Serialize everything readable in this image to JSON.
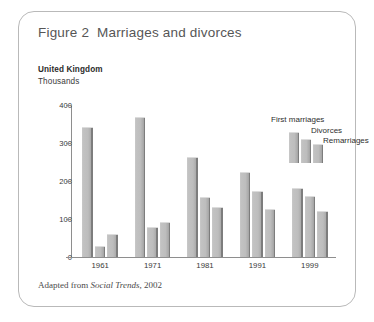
{
  "figure": {
    "title": "Figure 2  Marriages and divorces",
    "region_label": "United Kingdom",
    "unit_label": "Thousands",
    "source_prefix": "Adapted from ",
    "source_title": "Social Trends",
    "source_suffix": ", 2002"
  },
  "chart_data": {
    "type": "bar",
    "title": "Figure 2  Marriages and divorces",
    "subtitle": "United Kingdom",
    "xlabel": "",
    "ylabel": "Thousands",
    "ylim": [
      0,
      400
    ],
    "yticks": [
      0,
      100,
      200,
      300,
      400
    ],
    "ytick_labels": [
      "0",
      "100",
      "200",
      "300",
      "400"
    ],
    "grid": false,
    "legend_position": "top-right",
    "categories": [
      "1961",
      "1971",
      "1981",
      "1991",
      "1999"
    ],
    "series": [
      {
        "name": "First marriages",
        "values": [
          340,
          365,
          260,
          222,
          178
        ]
      },
      {
        "name": "Divorces",
        "values": [
          27,
          77,
          155,
          172,
          158
        ]
      },
      {
        "name": "Remarriages",
        "values": [
          57,
          89,
          130,
          125,
          119
        ]
      }
    ],
    "legend": [
      "First marriages",
      "Divorces",
      "Remarriages"
    ],
    "colors": {
      "bar_fill": "#bdbdbd",
      "bar_edge": "#7d7d7d",
      "axis": "#8e8e8e",
      "frame": "#b9b9b9",
      "title_text": "#565656"
    }
  },
  "legend_swatches": [
    {
      "label": "First marriages",
      "height_ratio": 1.0
    },
    {
      "label": "Divorces",
      "height_ratio": 0.78
    },
    {
      "label": "Remarriages",
      "height_ratio": 0.6
    }
  ]
}
